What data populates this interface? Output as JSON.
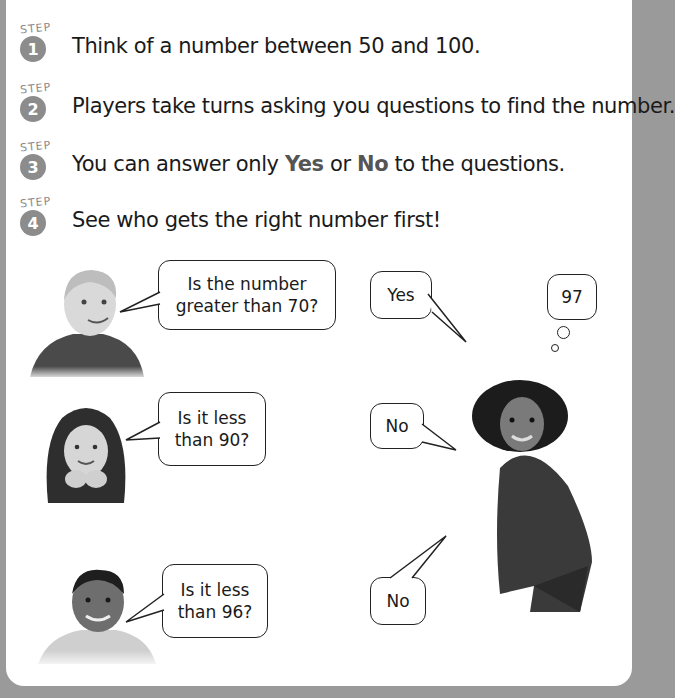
{
  "steps": [
    {
      "label": "STEP",
      "number": "1",
      "text": "Think of a number between 50 and 100."
    },
    {
      "label": "STEP",
      "number": "2",
      "text": "Players take turns asking you questions to find the number."
    },
    {
      "label": "STEP",
      "number": "3",
      "text_before": "You can answer only ",
      "bold_yes": "Yes",
      "text_mid": " or ",
      "bold_no": "No",
      "text_after": " to the questions."
    },
    {
      "label": "STEP",
      "number": "4",
      "text": "See who gets the right number first!"
    }
  ],
  "questions": [
    {
      "line1": "Is the number",
      "line2": "greater than 70?"
    },
    {
      "line1": "Is it less",
      "line2": "than 90?"
    },
    {
      "line1": "Is it less",
      "line2": "than 96?"
    }
  ],
  "answers": [
    "Yes",
    "No",
    "No"
  ],
  "thought": "97",
  "colors": {
    "badge": "#8c8c8c",
    "page_bg": "#ffffff",
    "frame": "#9a9a9a"
  }
}
